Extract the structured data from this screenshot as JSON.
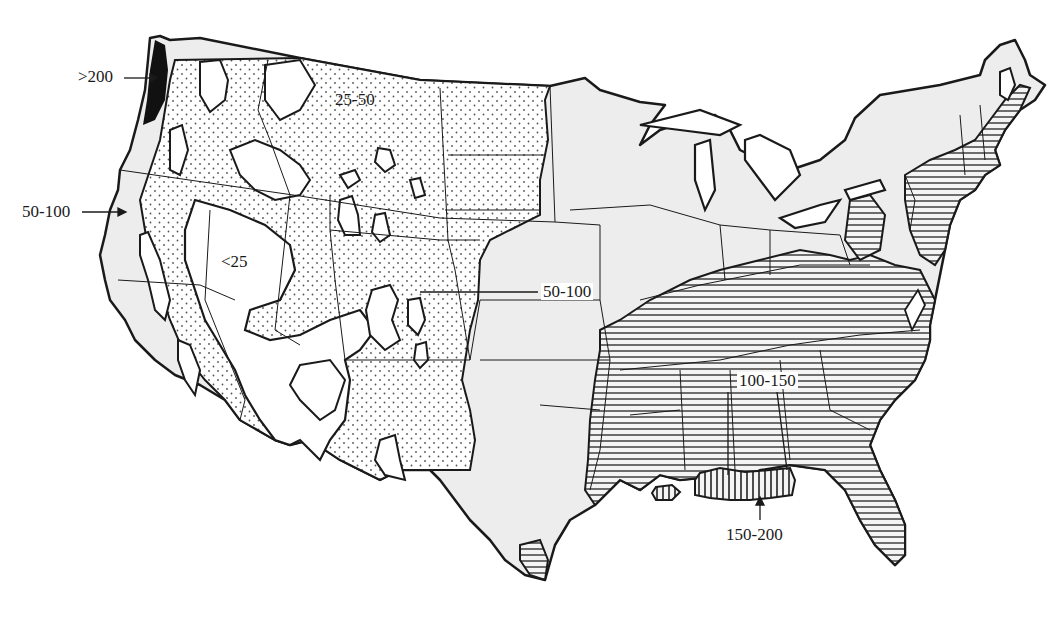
{
  "map": {
    "subject": "Contiguous United States precipitation zones",
    "colors": {
      "ink": "#1a1a1a",
      "background": "#ffffff",
      "stipple_grey": "#ededed",
      "dot": "#555555",
      "black_fill": "#111111"
    },
    "zones": [
      {
        "id": "lt25",
        "label": "<25",
        "pattern": "white"
      },
      {
        "id": "25to50",
        "label": "25-50",
        "pattern": "dots"
      },
      {
        "id": "50to100",
        "label": "50-100",
        "pattern": "light-grey-stipple"
      },
      {
        "id": "100to150",
        "label": "100-150",
        "pattern": "horizontal-lines"
      },
      {
        "id": "150to200",
        "label": "150-200",
        "pattern": "vertical-lines"
      },
      {
        "id": "gt200",
        "label": ">200",
        "pattern": "solid-black"
      }
    ],
    "labels": {
      "gt200": ">200",
      "west_50to100": "50-100",
      "lt25": "<25",
      "north_25to50": "25-50",
      "plains_50to100": "50-100",
      "southeast_100to150": "100-150",
      "gulf_150to200": "150-200"
    }
  }
}
